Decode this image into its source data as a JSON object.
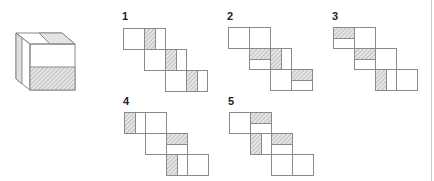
{
  "puzzle": {
    "reference_cube": {
      "front_face": {
        "x": 31,
        "y": 44,
        "w": 44,
        "h": 46,
        "hatched_half": "bottom"
      },
      "top_face": {
        "shaded_half": "right"
      },
      "left_face": {
        "shaded_strip": "outer"
      }
    },
    "colors": {
      "line": "#8a8a8a",
      "hatch_fg": "#9a9a9a",
      "hatch_bg": "#e6e6e6",
      "label": "#222222",
      "divider": "#c8c8c8"
    },
    "square_size": 21,
    "options": [
      {
        "label": "1",
        "label_pos": [
          122,
          20
        ],
        "origin": [
          123,
          28
        ],
        "rows": [
          {
            "dx": 0,
            "dy": 0,
            "shade": [
              {
                "sq": 1,
                "part": "left"
              }
            ]
          },
          {
            "dx": 21,
            "dy": 21,
            "shade": [
              {
                "sq": 1,
                "part": "left"
              }
            ]
          },
          {
            "dx": 42,
            "dy": 42,
            "shade": [
              {
                "sq": 1,
                "part": "left"
              }
            ]
          }
        ]
      },
      {
        "label": "2",
        "label_pos": [
          227,
          20
        ],
        "origin": [
          228,
          27
        ],
        "rows": [
          {
            "dx": 0,
            "dy": 0,
            "shade": []
          },
          {
            "dx": 21,
            "dy": 21,
            "shade": [
              {
                "sq": 0,
                "part": "top"
              },
              {
                "sq": 1,
                "part": "left"
              }
            ]
          },
          {
            "dx": 42,
            "dy": 42,
            "shade": [
              {
                "sq": 1,
                "part": "top"
              }
            ]
          }
        ]
      },
      {
        "label": "3",
        "label_pos": [
          332,
          20
        ],
        "origin": [
          333,
          27
        ],
        "rows": [
          {
            "dx": 0,
            "dy": 0,
            "shade": [
              {
                "sq": 0,
                "part": "top"
              }
            ]
          },
          {
            "dx": 21,
            "dy": 21,
            "shade": [
              {
                "sq": 0,
                "part": "top"
              }
            ]
          },
          {
            "dx": 42,
            "dy": 42,
            "shade": [
              {
                "sq": 0,
                "part": "left"
              }
            ]
          }
        ]
      },
      {
        "label": "4",
        "label_pos": [
          123,
          105
        ],
        "origin": [
          124,
          112
        ],
        "rows": [
          {
            "dx": 0,
            "dy": 0,
            "shade": [
              {
                "sq": 0,
                "part": "left"
              }
            ]
          },
          {
            "dx": 21,
            "dy": 21,
            "shade": [
              {
                "sq": 1,
                "part": "top"
              }
            ]
          },
          {
            "dx": 42,
            "dy": 42,
            "shade": [
              {
                "sq": 0,
                "part": "left"
              }
            ]
          }
        ]
      },
      {
        "label": "5",
        "label_pos": [
          228,
          105
        ],
        "origin": [
          229,
          112
        ],
        "rows": [
          {
            "dx": 0,
            "dy": 0,
            "shade": [
              {
                "sq": 1,
                "part": "top"
              }
            ]
          },
          {
            "dx": 21,
            "dy": 21,
            "shade": [
              {
                "sq": 0,
                "part": "left"
              },
              {
                "sq": 1,
                "part": "top"
              }
            ]
          },
          {
            "dx": 42,
            "dy": 42,
            "shade": []
          }
        ]
      }
    ]
  }
}
